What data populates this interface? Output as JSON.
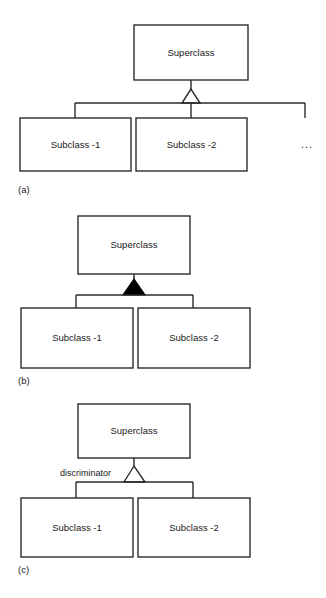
{
  "document": {
    "title": "UML Generalization Notations",
    "background_color": "#ffffff",
    "line_color": "#2b2b2b",
    "fill_color": "#ffffff",
    "filled_triangle_color": "#000000"
  },
  "figures": [
    {
      "id": "a",
      "caption": "(a)",
      "notation": "hollow-triangle-shared-target",
      "superclass": {
        "label": "Superclass"
      },
      "subclasses": [
        {
          "label": "Subclass -1"
        },
        {
          "label": "Subclass -2"
        }
      ],
      "continuation": "...",
      "triangle_style": "hollow",
      "discriminator": null
    },
    {
      "id": "b",
      "caption": "(b)",
      "notation": "filled-triangle-shared-target",
      "superclass": {
        "label": "Superclass"
      },
      "subclasses": [
        {
          "label": "Subclass -1"
        },
        {
          "label": "Subclass -2"
        }
      ],
      "continuation": null,
      "triangle_style": "filled",
      "discriminator": null
    },
    {
      "id": "c",
      "caption": "(c)",
      "notation": "hollow-triangle-with-discriminator",
      "superclass": {
        "label": "Superclass"
      },
      "subclasses": [
        {
          "label": "Subclass -1"
        },
        {
          "label": "Subclass -2"
        }
      ],
      "continuation": null,
      "triangle_style": "hollow",
      "discriminator": "discriminator"
    }
  ]
}
